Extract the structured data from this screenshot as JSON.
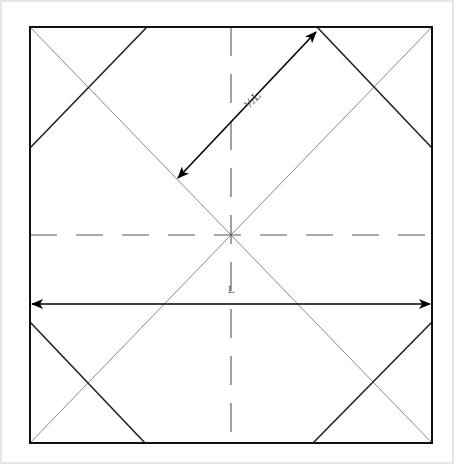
{
  "diagram": {
    "colors": {
      "background": "#ffffff",
      "frame": "#d0d0d0",
      "edge": "#111111",
      "thin_line": "#8a8a8a",
      "fold_line": "#222222",
      "dash_line": "#555555",
      "arrow": "#000000",
      "label": "#555555"
    },
    "square": {
      "x1": 30,
      "y1": 27,
      "x2": 432,
      "y2": 443
    },
    "center": {
      "x": 231,
      "y": 235
    },
    "labels": {
      "diagonal_dimension": "½L",
      "width_dimension": "L"
    },
    "dimensions": [
      {
        "name": "half-length",
        "label": "½L",
        "from": [
          176,
          180
        ],
        "to": [
          318,
          30
        ]
      },
      {
        "name": "length",
        "label": "L",
        "from": [
          30,
          304
        ],
        "to": [
          432,
          304
        ]
      }
    ],
    "corner_folds": [
      {
        "corner": "top-left",
        "from": [
          147,
          27
        ],
        "to": [
          30,
          148
        ]
      },
      {
        "corner": "top-right",
        "from": [
          317,
          27
        ],
        "to": [
          432,
          148
        ]
      },
      {
        "corner": "bottom-left",
        "from": [
          30,
          322
        ],
        "to": [
          145,
          443
        ]
      },
      {
        "corner": "bottom-right",
        "from": [
          313,
          443
        ],
        "to": [
          432,
          322
        ]
      }
    ]
  }
}
